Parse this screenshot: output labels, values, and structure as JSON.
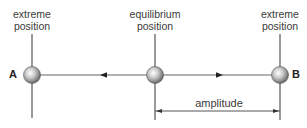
{
  "diagram": {
    "labels": {
      "left_top_line1": "extreme",
      "left_top_line2": "position",
      "center_top_line1": "equilibrium",
      "center_top_line2": "position",
      "right_top_line1": "extreme",
      "right_top_line2": "position",
      "point_a": "A",
      "point_b": "B",
      "amplitude": "amplitude"
    },
    "colors": {
      "line": "#555555",
      "ball_highlight": "#ffffff",
      "ball_shadow": "#6a6a6a",
      "text": "#3a3a3a"
    },
    "positions": {
      "left_extreme_x": 32,
      "equilibrium_x": 155,
      "right_extreme_x": 280,
      "axis_y": 75,
      "amplitude_y": 111
    }
  }
}
